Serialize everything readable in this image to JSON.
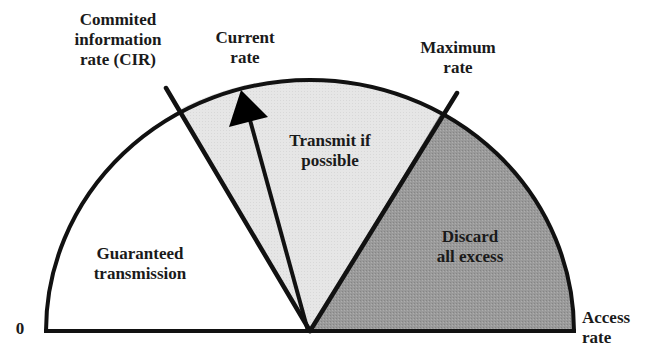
{
  "diagram": {
    "type": "gauge",
    "labels": {
      "cir": "Commited\ninformation\nrate (CIR)",
      "current_rate": "Current\nrate",
      "maximum_rate": "Maximum\nrate",
      "zero": "0",
      "access_rate": "Access\nrate"
    },
    "regions": [
      {
        "id": "guaranteed",
        "label": "Guaranteed\ntransmission",
        "fill": "#ffffff"
      },
      {
        "id": "transmit_if_possible",
        "label": "Transmit if\npossible",
        "fill": "#e6e6e6"
      },
      {
        "id": "discard",
        "label": "Discard\nall excess",
        "fill": "#9a9a9a"
      }
    ],
    "colors": {
      "stroke": "#111111",
      "background": "#ffffff"
    }
  }
}
